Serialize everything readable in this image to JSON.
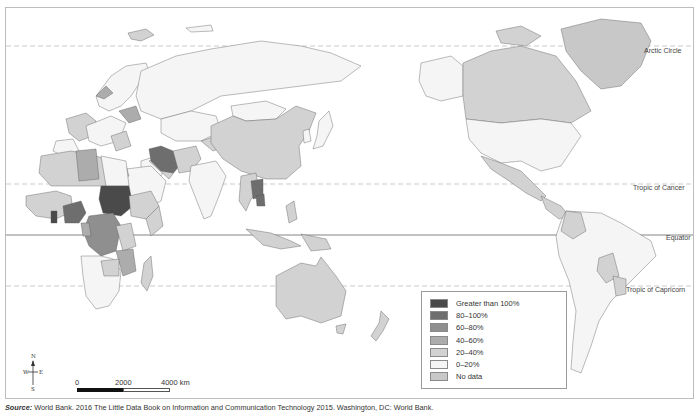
{
  "map": {
    "latitude_lines": [
      {
        "label": "Arctic Circle",
        "style": "dashed"
      },
      {
        "label": "Tropic of Cancer",
        "style": "dashed"
      },
      {
        "label": "Equator",
        "style": "solid"
      },
      {
        "label": "Tropic of Capricorn",
        "style": "dashed"
      }
    ],
    "legend": {
      "items": [
        {
          "label": "Greater than 100%",
          "color": "#4a4a4a"
        },
        {
          "label": "80–100%",
          "color": "#6e6e6e"
        },
        {
          "label": "60–80%",
          "color": "#8f8f8f"
        },
        {
          "label": "40–60%",
          "color": "#acacac"
        },
        {
          "label": "20–40%",
          "color": "#d2d2d2"
        },
        {
          "label": "0–20%",
          "color": "#f5f5f5"
        },
        {
          "label": "No data",
          "color": "#c8c8c8"
        }
      ]
    },
    "compass": {
      "n": "N",
      "s": "S",
      "e": "E",
      "w": "W"
    },
    "scale_bar": {
      "ticks": [
        "0",
        "2000",
        "4000 km"
      ]
    },
    "source": {
      "label": "Source:",
      "text": " World Bank. 2016 The Little Data Book on Information and Communication Technology 2015. Washington, DC: World Bank."
    }
  }
}
